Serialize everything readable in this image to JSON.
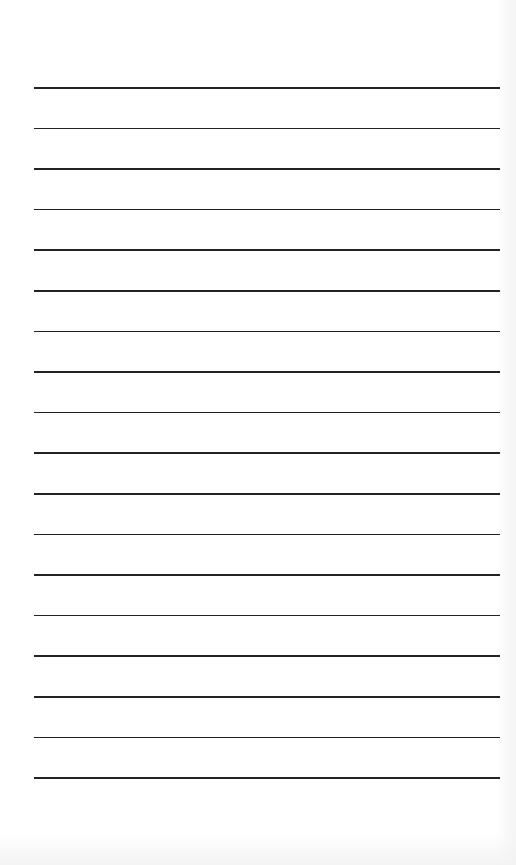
{
  "page": {
    "type": "lined-paper",
    "background_color": "#ffffff",
    "line_color": "#222222",
    "line_count": 18,
    "line_left": 34,
    "line_right": 500,
    "first_line_y": 87,
    "line_spacing": 40.6
  }
}
